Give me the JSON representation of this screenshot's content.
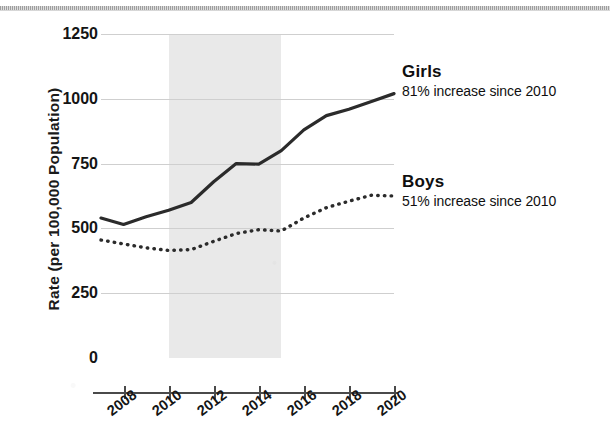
{
  "chart_data": {
    "type": "line",
    "title": "",
    "xlabel": "",
    "ylabel": "Rate (per 100,000 Population)",
    "x": [
      2007,
      2008,
      2009,
      2010,
      2011,
      2012,
      2013,
      2014,
      2015,
      2016,
      2017,
      2018,
      2019,
      2020
    ],
    "xlim": [
      2007,
      2020
    ],
    "ylim": [
      0,
      1250
    ],
    "xticks": [
      "2008",
      "2010",
      "2012",
      "2014",
      "2016",
      "2018",
      "2020"
    ],
    "xtick_values": [
      2008,
      2010,
      2012,
      2014,
      2016,
      2018,
      2020
    ],
    "yticks": [
      "0",
      "250",
      "500",
      "750",
      "1000",
      "1250"
    ],
    "ytick_values": [
      0,
      250,
      500,
      750,
      1000,
      1250
    ],
    "grid": "horizontal",
    "legend_position": "right-inline-annotation",
    "shaded_region": {
      "label": "",
      "x_start": 2010,
      "x_end": 2015,
      "color": "#e9e9e9"
    },
    "series": [
      {
        "name": "Girls",
        "style": "solid",
        "color": "#2b2b2b",
        "annotation_title": "Girls",
        "annotation_sub": "81% increase since 2010",
        "values": [
          540,
          515,
          545,
          570,
          600,
          680,
          750,
          748,
          800,
          880,
          935,
          960,
          990,
          1020
        ]
      },
      {
        "name": "Boys",
        "style": "dotted",
        "color": "#2b2b2b",
        "annotation_title": "Boys",
        "annotation_sub": "51% increase since 2010",
        "values": [
          455,
          440,
          425,
          415,
          418,
          450,
          480,
          495,
          490,
          540,
          580,
          605,
          628,
          625
        ]
      }
    ]
  }
}
